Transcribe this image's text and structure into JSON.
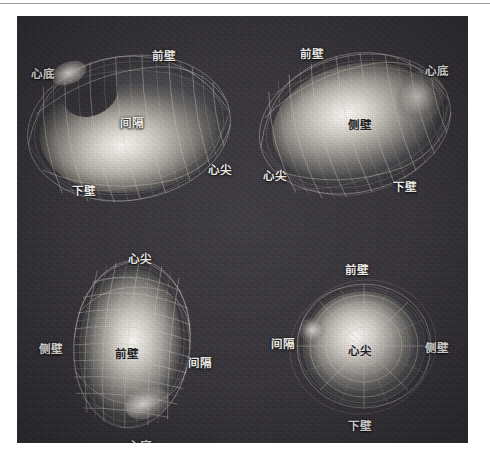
{
  "figure": {
    "plate_background_color": "#343137",
    "label_color": "#f2f0ec",
    "dark_label_color": "#1b1a1c",
    "top_rule_color": "#9a9a9a"
  },
  "views": [
    {
      "id": "view-top-left",
      "name": "septal-long-axis-view",
      "labels": [
        {
          "name": "label-cardiac-base",
          "text": "心底",
          "x": 31,
          "y": 68,
          "tone": "light"
        },
        {
          "name": "label-anterior-wall",
          "text": "前壁",
          "x": 152,
          "y": 50,
          "tone": "light"
        },
        {
          "name": "label-septum",
          "text": "间隔",
          "x": 120,
          "y": 117,
          "tone": "light"
        },
        {
          "name": "label-apex",
          "text": "心尖",
          "x": 208,
          "y": 164,
          "tone": "light"
        },
        {
          "name": "label-inferior-wall",
          "text": "下壁",
          "x": 72,
          "y": 185,
          "tone": "light"
        }
      ]
    },
    {
      "id": "view-top-right",
      "name": "lateral-long-axis-view",
      "labels": [
        {
          "name": "label-anterior-wall",
          "text": "前壁",
          "x": 300,
          "y": 48,
          "tone": "light"
        },
        {
          "name": "label-cardiac-base",
          "text": "心底",
          "x": 425,
          "y": 65,
          "tone": "light"
        },
        {
          "name": "label-lateral-wall",
          "text": "侧壁",
          "x": 348,
          "y": 119,
          "tone": "dark"
        },
        {
          "name": "label-apex",
          "text": "心尖",
          "x": 263,
          "y": 170,
          "tone": "light"
        },
        {
          "name": "label-inferior-wall",
          "text": "下壁",
          "x": 393,
          "y": 181,
          "tone": "light"
        }
      ]
    },
    {
      "id": "view-bottom-left",
      "name": "anterior-long-axis-view",
      "labels": [
        {
          "name": "label-apex",
          "text": "心尖",
          "x": 128,
          "y": 243,
          "tone": "light"
        },
        {
          "name": "label-lateral-wall",
          "text": "侧壁",
          "x": 39,
          "y": 333,
          "tone": "light"
        },
        {
          "name": "label-anterior-wall",
          "text": "前壁",
          "x": 115,
          "y": 338,
          "tone": "dark"
        },
        {
          "name": "label-septum",
          "text": "间隔",
          "x": 188,
          "y": 347,
          "tone": "light"
        },
        {
          "name": "label-cardiac-base",
          "text": "心底",
          "x": 128,
          "y": 430,
          "tone": "light"
        }
      ]
    },
    {
      "id": "view-bottom-right",
      "name": "apical-short-axis-view",
      "labels": [
        {
          "name": "label-anterior-wall",
          "text": "前壁",
          "x": 345,
          "y": 264,
          "tone": "light"
        },
        {
          "name": "label-septum",
          "text": "间隔",
          "x": 271,
          "y": 338,
          "tone": "light"
        },
        {
          "name": "label-apex",
          "text": "心尖",
          "x": 348,
          "y": 345,
          "tone": "dark"
        },
        {
          "name": "label-lateral-wall",
          "text": "侧壁",
          "x": 425,
          "y": 342,
          "tone": "light"
        },
        {
          "name": "label-inferior-wall",
          "text": "下壁",
          "x": 348,
          "y": 420,
          "tone": "light"
        }
      ]
    }
  ]
}
